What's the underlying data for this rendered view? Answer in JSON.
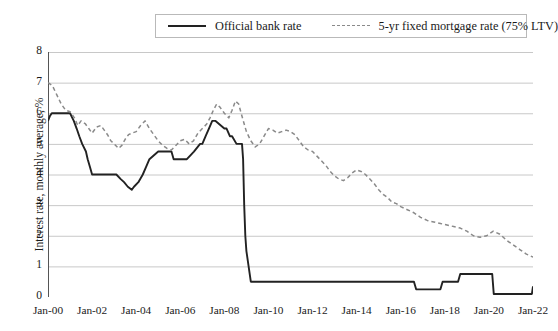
{
  "chart_data": {
    "type": "line",
    "title": "",
    "xlabel": "",
    "ylabel": "Interest rate, monthly average, %",
    "ylim": [
      0,
      8
    ],
    "yticks": [
      0,
      1,
      2,
      3,
      4,
      5,
      6,
      7,
      8
    ],
    "xlim": [
      "Jan-00",
      "Jan-22"
    ],
    "xticks": [
      "Jan-00",
      "Jan-02",
      "Jan-04",
      "Jan-06",
      "Jan-08",
      "Jan-10",
      "Jan-12",
      "Jan-14",
      "Jan-16",
      "Jan-18",
      "Jan-20",
      "Jan-22"
    ],
    "minor_xticks_per_interval": 1,
    "grid": "horizontal",
    "legend_position": "top-center",
    "background": "#ffffff",
    "gridline_color": "#c8c8c8",
    "series": [
      {
        "name": "Official bank rate",
        "style": "solid",
        "color": "#222222",
        "x": [
          2000.0,
          2000.08,
          2000.17,
          2001.0,
          2001.17,
          2001.3,
          2001.42,
          2001.55,
          2001.72,
          2001.8,
          2001.9,
          2002.0,
          2003.1,
          2003.3,
          2003.45,
          2003.62,
          2003.8,
          2003.9,
          2004.1,
          2004.3,
          2004.45,
          2004.6,
          2005.0,
          2005.6,
          2005.7,
          2006.3,
          2006.62,
          2006.9,
          2007.0,
          2007.15,
          2007.3,
          2007.45,
          2007.6,
          2008.0,
          2008.1,
          2008.25,
          2008.35,
          2008.55,
          2008.72,
          2008.8,
          2008.85,
          2008.9,
          2008.95,
          2009.0,
          2009.1,
          2009.2,
          2009.3,
          2016.0,
          2016.6,
          2016.7,
          2017.8,
          2017.9,
          2018.6,
          2018.7,
          2020.15,
          2020.22,
          2021.95,
          2022.0
        ],
        "y": [
          5.75,
          5.9,
          6.0,
          6.0,
          5.75,
          5.5,
          5.25,
          5.0,
          4.75,
          4.5,
          4.25,
          4.0,
          4.0,
          3.85,
          3.75,
          3.6,
          3.5,
          3.6,
          3.75,
          4.0,
          4.25,
          4.5,
          4.75,
          4.75,
          4.5,
          4.5,
          4.75,
          5.0,
          5.0,
          5.25,
          5.5,
          5.75,
          5.75,
          5.5,
          5.5,
          5.25,
          5.25,
          5.0,
          5.0,
          5.0,
          4.5,
          3.0,
          2.0,
          1.5,
          1.0,
          0.5,
          0.5,
          0.5,
          0.5,
          0.25,
          0.25,
          0.5,
          0.5,
          0.75,
          0.75,
          0.1,
          0.1,
          0.35
        ],
        "annotations": [
          {
            "label": "Pre-crisis peak",
            "value": 5.75,
            "year": 2007.5
          },
          {
            "label": "Post-crisis floor",
            "value": 0.5,
            "year": 2009.3
          },
          {
            "label": "Pandemic floor",
            "value": 0.1,
            "year": 2020.3
          }
        ]
      },
      {
        "name": "5-yr fixed mortgage rate (75% LTV)",
        "style": "dashed",
        "color": "#8a8a8a",
        "x": [
          2000.0,
          2000.2,
          2000.4,
          2000.6,
          2000.8,
          2001.0,
          2001.2,
          2001.35,
          2001.5,
          2001.7,
          2001.85,
          2002.0,
          2002.2,
          2002.4,
          2002.55,
          2002.7,
          2002.85,
          2003.0,
          2003.2,
          2003.35,
          2003.5,
          2003.65,
          2003.8,
          2004.0,
          2004.2,
          2004.4,
          2004.6,
          2004.8,
          2005.0,
          2005.2,
          2005.4,
          2005.6,
          2005.8,
          2006.0,
          2006.2,
          2006.4,
          2006.6,
          2006.8,
          2007.0,
          2007.2,
          2007.35,
          2007.5,
          2007.65,
          2007.8,
          2008.0,
          2008.2,
          2008.35,
          2008.5,
          2008.65,
          2008.8,
          2009.0,
          2009.2,
          2009.4,
          2009.6,
          2009.8,
          2010.0,
          2010.2,
          2010.4,
          2010.6,
          2010.8,
          2011.0,
          2011.2,
          2011.4,
          2011.6,
          2011.8,
          2012.0,
          2012.2,
          2012.4,
          2012.6,
          2012.8,
          2013.0,
          2013.2,
          2013.4,
          2013.6,
          2013.8,
          2014.0,
          2014.2,
          2014.4,
          2014.6,
          2014.8,
          2015.0,
          2015.2,
          2015.4,
          2015.6,
          2015.8,
          2016.0,
          2016.3,
          2016.6,
          2016.9,
          2017.2,
          2017.5,
          2017.8,
          2018.1,
          2018.4,
          2018.7,
          2019.0,
          2019.3,
          2019.6,
          2019.9,
          2020.2,
          2020.5,
          2020.8,
          2021.1,
          2021.4,
          2021.7,
          2022.0
        ],
        "y": [
          7.0,
          6.9,
          6.6,
          6.3,
          6.1,
          6.05,
          5.85,
          5.6,
          5.75,
          5.65,
          5.5,
          5.35,
          5.55,
          5.6,
          5.45,
          5.3,
          5.1,
          5.0,
          4.85,
          4.95,
          5.15,
          5.3,
          5.35,
          5.4,
          5.6,
          5.75,
          5.5,
          5.3,
          5.1,
          4.95,
          4.85,
          4.8,
          4.95,
          5.1,
          5.15,
          5.0,
          5.1,
          5.35,
          5.5,
          5.65,
          5.85,
          6.1,
          6.3,
          6.2,
          6.0,
          5.85,
          6.1,
          6.4,
          6.3,
          5.9,
          5.4,
          5.1,
          4.9,
          5.0,
          5.25,
          5.5,
          5.45,
          5.35,
          5.4,
          5.45,
          5.4,
          5.3,
          5.1,
          4.9,
          4.8,
          4.75,
          4.6,
          4.45,
          4.3,
          4.1,
          3.95,
          3.85,
          3.8,
          3.9,
          4.05,
          4.15,
          4.1,
          4.0,
          3.85,
          3.7,
          3.5,
          3.35,
          3.25,
          3.1,
          3.05,
          2.95,
          2.85,
          2.75,
          2.6,
          2.5,
          2.45,
          2.4,
          2.35,
          2.3,
          2.25,
          2.15,
          2.0,
          1.95,
          2.0,
          2.15,
          2.05,
          1.85,
          1.7,
          1.55,
          1.4,
          1.3
        ],
        "annotations": [
          {
            "label": "Start",
            "value": 7.0,
            "year": 2000.0
          },
          {
            "label": "2008 peak",
            "value": 6.4,
            "year": 2008.5
          },
          {
            "label": "End",
            "value": 1.3,
            "year": 2022.0
          }
        ]
      }
    ]
  },
  "legend": {
    "items": [
      {
        "label": "Official bank rate",
        "style": "solid"
      },
      {
        "label": "5-yr fixed mortgage rate (75% LTV)",
        "style": "dashed"
      }
    ]
  },
  "axes": {
    "y_title": "Interest rate, monthly average, %"
  }
}
